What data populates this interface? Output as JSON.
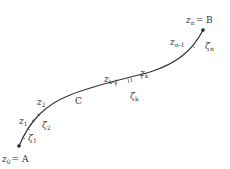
{
  "diagram": {
    "curve_label": "C",
    "start": {
      "var": "z",
      "sub": "0",
      "eq": "= A"
    },
    "end": {
      "var": "z",
      "sub": "n",
      "eq": "= B"
    },
    "points": [
      {
        "var": "z",
        "sub": "1"
      },
      {
        "var": "z",
        "sub": "2"
      },
      {
        "var": "z",
        "sub": "k-1"
      },
      {
        "var": "z",
        "sub": "k"
      },
      {
        "var": "z",
        "sub": "n-1"
      }
    ],
    "sample_points": [
      {
        "var": "ζ",
        "sub": "1"
      },
      {
        "var": "ζ",
        "sub": "2"
      },
      {
        "var": "ζ",
        "sub": "k"
      },
      {
        "var": "ζ",
        "sub": "n"
      }
    ],
    "colors": {
      "curve": "#333333",
      "text": "#333333",
      "background": "#ffffff"
    }
  }
}
